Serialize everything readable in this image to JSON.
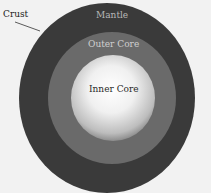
{
  "diagram": {
    "labels": {
      "crust": "Crust",
      "mantle": "Mantle",
      "outer_core": "Outer Core",
      "inner_core": "Inner Core"
    },
    "colors": {
      "background": "#f2f2f2",
      "mantle": "#3a3a3a",
      "outer_core": "#6a6a6a",
      "inner_core": "#f0f0f0"
    }
  }
}
